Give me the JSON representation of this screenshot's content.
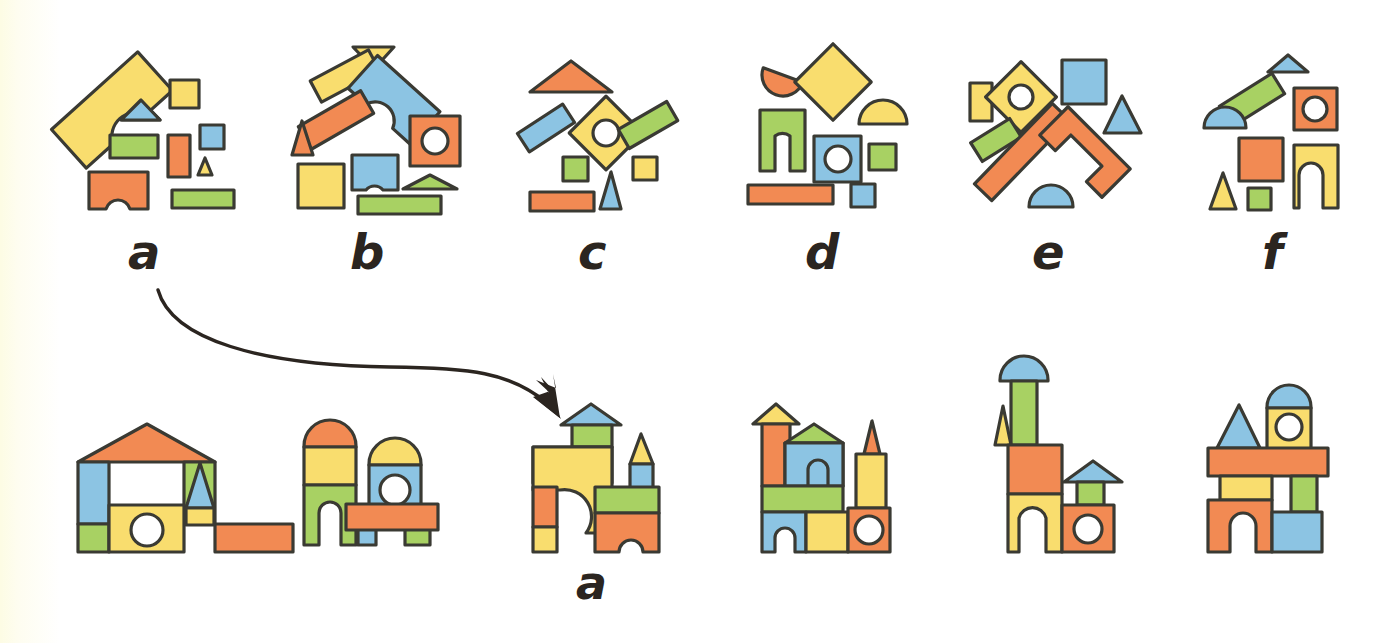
{
  "page": {
    "background_color": "#ffffff",
    "left_edge_tint": "#fdfce4",
    "outline_color": "#3a3a33",
    "label_color": "#2b2520"
  },
  "palette": {
    "yellow": "#f9dd6e",
    "orange": "#f28a53",
    "green": "#a8d163",
    "blue": "#8cc4e3",
    "white": "#ffffff"
  },
  "top_row": {
    "description": "Six scattered sets of building blocks, each labelled with a letter",
    "labels": [
      "a",
      "b",
      "c",
      "d",
      "e",
      "f"
    ],
    "sets": [
      {
        "label": "a",
        "block_count": 8,
        "blocks": [
          {
            "shape": "arch-rotated",
            "color": "yellow"
          },
          {
            "shape": "square-small",
            "color": "yellow"
          },
          {
            "shape": "triangle-wide",
            "color": "blue"
          },
          {
            "shape": "rectangle-wide",
            "color": "green"
          },
          {
            "shape": "rectangle-tall",
            "color": "orange"
          },
          {
            "shape": "square-small",
            "color": "blue"
          },
          {
            "shape": "triangle-small",
            "color": "yellow"
          },
          {
            "shape": "arch-block",
            "color": "orange"
          },
          {
            "shape": "rectangle-wide",
            "color": "green"
          }
        ]
      },
      {
        "label": "b",
        "block_count": 10,
        "blocks": [
          {
            "shape": "triangle-wide",
            "color": "yellow"
          },
          {
            "shape": "rectangle-rotated",
            "color": "yellow"
          },
          {
            "shape": "arch-rotated",
            "color": "blue"
          },
          {
            "shape": "rectangle-rotated",
            "color": "orange"
          },
          {
            "shape": "square-hole",
            "color": "orange"
          },
          {
            "shape": "triangle-tall",
            "color": "orange"
          },
          {
            "shape": "square-large",
            "color": "yellow"
          },
          {
            "shape": "arch-block",
            "color": "blue"
          },
          {
            "shape": "triangle-wide",
            "color": "green"
          },
          {
            "shape": "rectangle-wide",
            "color": "green"
          }
        ]
      },
      {
        "label": "c",
        "block_count": 8,
        "blocks": [
          {
            "shape": "triangle-wide",
            "color": "orange"
          },
          {
            "shape": "rectangle-rotated",
            "color": "blue"
          },
          {
            "shape": "diamond-hole",
            "color": "yellow"
          },
          {
            "shape": "rectangle-rotated",
            "color": "green"
          },
          {
            "shape": "square-small",
            "color": "green"
          },
          {
            "shape": "square-small",
            "color": "yellow"
          },
          {
            "shape": "rectangle-wide",
            "color": "orange"
          },
          {
            "shape": "triangle-tall",
            "color": "blue"
          }
        ]
      },
      {
        "label": "d",
        "block_count": 8,
        "blocks": [
          {
            "shape": "semicircle-rotated",
            "color": "orange"
          },
          {
            "shape": "diamond",
            "color": "yellow"
          },
          {
            "shape": "semicircle",
            "color": "yellow"
          },
          {
            "shape": "arch-block",
            "color": "green"
          },
          {
            "shape": "square-hole",
            "color": "blue"
          },
          {
            "shape": "square-small",
            "color": "green"
          },
          {
            "shape": "rectangle-wide",
            "color": "orange"
          },
          {
            "shape": "square-small",
            "color": "blue"
          }
        ]
      },
      {
        "label": "e",
        "block_count": 8,
        "blocks": [
          {
            "shape": "rectangle-tall",
            "color": "yellow"
          },
          {
            "shape": "diamond-hole",
            "color": "yellow"
          },
          {
            "shape": "square-large",
            "color": "blue"
          },
          {
            "shape": "triangle-tall",
            "color": "blue"
          },
          {
            "shape": "rectangle-rotated",
            "color": "green"
          },
          {
            "shape": "rectangle-rotated-long",
            "color": "orange"
          },
          {
            "shape": "arch-rotated",
            "color": "orange"
          },
          {
            "shape": "semicircle",
            "color": "blue"
          }
        ]
      },
      {
        "label": "f",
        "block_count": 8,
        "blocks": [
          {
            "shape": "triangle-wide",
            "color": "blue"
          },
          {
            "shape": "rectangle-rotated",
            "color": "green"
          },
          {
            "shape": "square-hole",
            "color": "orange"
          },
          {
            "shape": "semicircle",
            "color": "blue"
          },
          {
            "shape": "square-large",
            "color": "orange"
          },
          {
            "shape": "arch-block",
            "color": "yellow"
          },
          {
            "shape": "triangle-tall",
            "color": "yellow"
          },
          {
            "shape": "square-small",
            "color": "green"
          }
        ]
      }
    ]
  },
  "bottom_row": {
    "description": "Six assembled block structures; the third is labelled 'a'",
    "labels": [
      "",
      "",
      "a",
      "",
      "",
      ""
    ],
    "structures": [
      {
        "index": 1,
        "name": "house-with-roof-and-spire",
        "labelled": false,
        "label": ""
      },
      {
        "index": 2,
        "name": "twin-towers-with-bridge",
        "labelled": false,
        "label": ""
      },
      {
        "index": 3,
        "name": "archway-castle",
        "labelled": true,
        "label": "a"
      },
      {
        "index": 4,
        "name": "castle-with-two-spires",
        "labelled": false,
        "label": ""
      },
      {
        "index": 5,
        "name": "tall-tower-and-small-house",
        "labelled": false,
        "label": ""
      },
      {
        "index": 6,
        "name": "bridge-tower-structure",
        "labelled": false,
        "label": ""
      }
    ]
  },
  "arrow": {
    "name": "match-arrow",
    "from_label": "a",
    "to_label": "a",
    "direction": "curved-right-down"
  }
}
